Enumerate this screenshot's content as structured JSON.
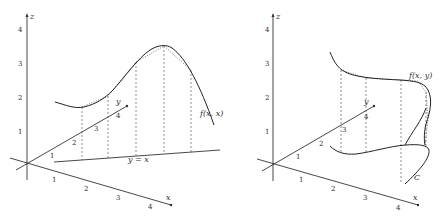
{
  "left_figure": {
    "axis_labels": {
      "x": "x",
      "y": "y",
      "z": "z"
    },
    "z_ticks": [
      "1",
      "2",
      "3",
      "4"
    ],
    "x_ticks": [
      "1",
      "2",
      "3",
      "4"
    ],
    "y_ticks": [
      "1",
      "2",
      "3",
      "4"
    ],
    "line_label": "y = x",
    "curve_label": "f(x, x)"
  },
  "right_figure": {
    "axis_labels": {
      "x": "x",
      "y": "y",
      "z": "z"
    },
    "z_ticks": [
      "1",
      "2",
      "3",
      "4"
    ],
    "x_ticks": [
      "1",
      "2",
      "3",
      "4"
    ],
    "y_ticks": [
      "1",
      "2",
      "3",
      "4"
    ],
    "path_label": "C",
    "curve_label": "f(x, y)"
  }
}
